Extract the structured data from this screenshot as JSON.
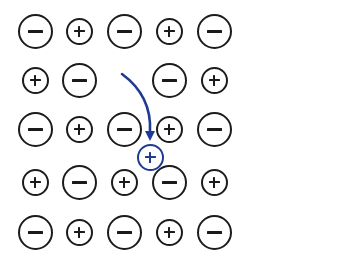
{
  "figure": {
    "background_color": "#ffffff",
    "canvas": {
      "width": 346,
      "height": 262
    },
    "grid": {
      "columns": 5,
      "rows": 5,
      "column_centers_px": [
        35,
        79,
        124,
        169,
        214
      ],
      "row_centers_px": [
        31,
        80,
        129,
        182,
        232
      ]
    },
    "ion_styles": {
      "anion": {
        "label": "−",
        "semantic": "negative-ion",
        "diameter_px": 35,
        "stroke_color": "#1c1c1c",
        "glyph_color": "#1a1a1a"
      },
      "cation": {
        "label": "+",
        "semantic": "positive-ion",
        "diameter_px": 27,
        "stroke_color": "#1c1c1c",
        "glyph_color": "#1a1a1a"
      },
      "highlight": {
        "label": "+",
        "semantic": "migrating-positive-ion",
        "diameter_px": 27,
        "stroke_color": "#1f3a93",
        "glyph_color": "#1f3a93"
      }
    },
    "arrow": {
      "semantic": "migration-arrow",
      "color": "#1f3a93",
      "stroke_width_px": 2.6,
      "start_px": [
        122,
        74
      ],
      "end_px": [
        150,
        141
      ],
      "control_px": [
        152,
        96
      ],
      "head_length_px": 9,
      "head_half_width_px": 5
    },
    "rows": [
      {
        "index": 1,
        "cells": [
          {
            "type": "anion",
            "label": "−",
            "cx": 35,
            "cy": 31
          },
          {
            "type": "cation",
            "label": "+",
            "cx": 79,
            "cy": 31
          },
          {
            "type": "anion",
            "label": "−",
            "cx": 124,
            "cy": 31
          },
          {
            "type": "cation",
            "label": "+",
            "cx": 169,
            "cy": 31
          },
          {
            "type": "anion",
            "label": "−",
            "cx": 214,
            "cy": 31
          }
        ]
      },
      {
        "index": 2,
        "cells": [
          {
            "type": "cation",
            "label": "+",
            "cx": 35,
            "cy": 80
          },
          {
            "type": "anion",
            "label": "−",
            "cx": 79,
            "cy": 80
          },
          {
            "type": "vacancy",
            "label": "",
            "cx": 124,
            "cy": 80
          },
          {
            "type": "anion",
            "label": "−",
            "cx": 169,
            "cy": 80
          },
          {
            "type": "cation",
            "label": "+",
            "cx": 214,
            "cy": 80
          }
        ]
      },
      {
        "index": 3,
        "cells": [
          {
            "type": "anion",
            "label": "−",
            "cx": 35,
            "cy": 129
          },
          {
            "type": "cation",
            "label": "+",
            "cx": 79,
            "cy": 129
          },
          {
            "type": "anion",
            "label": "−",
            "cx": 124,
            "cy": 129
          },
          {
            "type": "cation",
            "label": "+",
            "cx": 169,
            "cy": 129
          },
          {
            "type": "anion",
            "label": "−",
            "cx": 214,
            "cy": 129
          }
        ]
      },
      {
        "index": 4,
        "cells": [
          {
            "type": "cation",
            "label": "+",
            "cx": 35,
            "cy": 182
          },
          {
            "type": "anion",
            "label": "−",
            "cx": 79,
            "cy": 182
          },
          {
            "type": "cation",
            "label": "+",
            "cx": 124,
            "cy": 182
          },
          {
            "type": "anion",
            "label": "−",
            "cx": 169,
            "cy": 182
          },
          {
            "type": "cation",
            "label": "+",
            "cx": 214,
            "cy": 182
          }
        ]
      },
      {
        "index": 5,
        "cells": [
          {
            "type": "anion",
            "label": "−",
            "cx": 35,
            "cy": 232
          },
          {
            "type": "cation",
            "label": "+",
            "cx": 79,
            "cy": 232
          },
          {
            "type": "anion",
            "label": "−",
            "cx": 124,
            "cy": 232
          },
          {
            "type": "cation",
            "label": "+",
            "cx": 169,
            "cy": 232
          },
          {
            "type": "anion",
            "label": "−",
            "cx": 214,
            "cy": 232
          }
        ]
      }
    ],
    "interstitial_ions": [
      {
        "type": "highlight",
        "label": "+",
        "cx": 150,
        "cy": 157
      }
    ]
  }
}
